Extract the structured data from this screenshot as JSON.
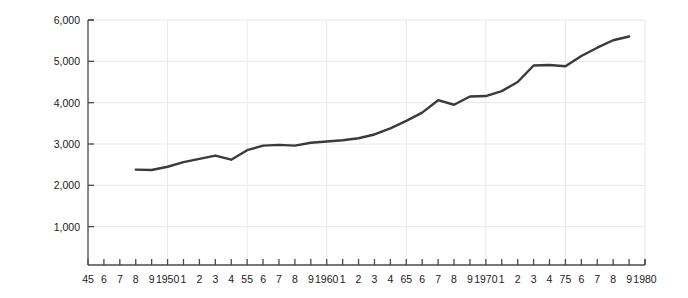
{
  "chart_data": {
    "type": "line",
    "title": "",
    "xlabel": "",
    "ylabel": "Per capita real GNP, 1972 dollars",
    "ylim": [
      0,
      6000
    ],
    "xlim": [
      1945,
      1980
    ],
    "grid": true,
    "legend": null,
    "line_color": "#3a3a3a",
    "axis_color": "#4a4a4a",
    "grid_color": "#e8e8e8",
    "y_ticks": [
      {
        "value": 6000,
        "label": "6,000"
      },
      {
        "value": 5000,
        "label": "5,000"
      },
      {
        "value": 4000,
        "label": "4,000"
      },
      {
        "value": 3000,
        "label": "3,000"
      },
      {
        "value": 2000,
        "label": "2,000"
      },
      {
        "value": 1000,
        "label": "1,000"
      }
    ],
    "x_ticks": [
      {
        "value": 1945,
        "label": "45"
      },
      {
        "value": 1946,
        "label": "6"
      },
      {
        "value": 1947,
        "label": "7"
      },
      {
        "value": 1948,
        "label": "8"
      },
      {
        "value": 1949,
        "label": "9"
      },
      {
        "value": 1950,
        "label": "1950"
      },
      {
        "value": 1951,
        "label": "1"
      },
      {
        "value": 1952,
        "label": "2"
      },
      {
        "value": 1953,
        "label": "3"
      },
      {
        "value": 1954,
        "label": "4"
      },
      {
        "value": 1955,
        "label": "55"
      },
      {
        "value": 1956,
        "label": "6"
      },
      {
        "value": 1957,
        "label": "7"
      },
      {
        "value": 1958,
        "label": "8"
      },
      {
        "value": 1959,
        "label": "9"
      },
      {
        "value": 1960,
        "label": "1960"
      },
      {
        "value": 1961,
        "label": "1"
      },
      {
        "value": 1962,
        "label": "2"
      },
      {
        "value": 1963,
        "label": "3"
      },
      {
        "value": 1964,
        "label": "4"
      },
      {
        "value": 1965,
        "label": "65"
      },
      {
        "value": 1966,
        "label": "6"
      },
      {
        "value": 1967,
        "label": "7"
      },
      {
        "value": 1968,
        "label": "8"
      },
      {
        "value": 1969,
        "label": "9"
      },
      {
        "value": 1970,
        "label": "1970"
      },
      {
        "value": 1971,
        "label": "1"
      },
      {
        "value": 1972,
        "label": "2"
      },
      {
        "value": 1973,
        "label": "3"
      },
      {
        "value": 1974,
        "label": "4"
      },
      {
        "value": 1975,
        "label": "75"
      },
      {
        "value": 1976,
        "label": "6"
      },
      {
        "value": 1977,
        "label": "7"
      },
      {
        "value": 1978,
        "label": "8"
      },
      {
        "value": 1979,
        "label": "9"
      },
      {
        "value": 1980,
        "label": "1980"
      }
    ],
    "x": [
      1948,
      1949,
      1950,
      1951,
      1952,
      1953,
      1954,
      1955,
      1956,
      1957,
      1958,
      1959,
      1960,
      1961,
      1962,
      1963,
      1964,
      1965,
      1966,
      1967,
      1968,
      1969,
      1970,
      1971,
      1972,
      1973,
      1974,
      1975,
      1976,
      1977,
      1978,
      1979
    ],
    "values": [
      2380,
      2370,
      2450,
      2560,
      2640,
      2720,
      2620,
      2850,
      2960,
      2980,
      2960,
      3030,
      3060,
      3090,
      3140,
      3230,
      3380,
      3560,
      3760,
      4060,
      3950,
      4150,
      4160,
      4280,
      4500,
      4900,
      4910,
      4880,
      5130,
      5330,
      5510,
      5600
    ]
  }
}
